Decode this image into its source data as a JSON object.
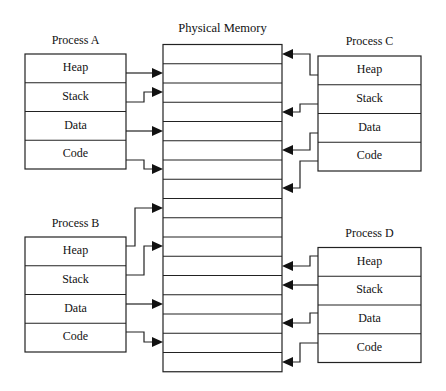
{
  "diagram": {
    "title": "Physical Memory",
    "colors": {
      "stroke": "#222222",
      "background": "#ffffff",
      "text": "#111111"
    },
    "memory": {
      "x": 163,
      "y": 44.5,
      "width": 119,
      "rows": 17,
      "row_height": 19.25
    },
    "processes": [
      {
        "name": "Process A",
        "side": "left",
        "box": {
          "x": 25,
          "y": 54,
          "width": 101,
          "row_height": 28.75
        },
        "label_y": 33,
        "segments": [
          "Heap",
          "Stack",
          "Data",
          "Code"
        ],
        "arrows": [
          {
            "segment": "Heap",
            "from_y": 73,
            "bend_x": 144,
            "to_y": 73
          },
          {
            "segment": "Stack",
            "from_y": 102,
            "bend_x": 144,
            "to_y": 92
          },
          {
            "segment": "Data",
            "from_y": 131,
            "bend_x": 144,
            "to_y": 131
          },
          {
            "segment": "Code",
            "from_y": 160,
            "bend_x": 144,
            "to_y": 169
          }
        ]
      },
      {
        "name": "Process B",
        "side": "left",
        "box": {
          "x": 25,
          "y": 237,
          "width": 101,
          "row_height": 28.75
        },
        "label_y": 216,
        "segments": [
          "Heap",
          "Stack",
          "Data",
          "Code"
        ],
        "arrows": [
          {
            "segment": "Heap",
            "from_y": 246,
            "bend_x": 135,
            "to_y": 208
          },
          {
            "segment": "Stack",
            "from_y": 275,
            "bend_x": 144,
            "to_y": 246
          },
          {
            "segment": "Data",
            "from_y": 304,
            "bend_x": 144,
            "to_y": 304
          },
          {
            "segment": "Code",
            "from_y": 332,
            "bend_x": 144,
            "to_y": 342
          }
        ]
      },
      {
        "name": "Process C",
        "side": "right",
        "box": {
          "x": 318,
          "y": 56,
          "width": 103,
          "row_height": 28.75
        },
        "label_y": 34,
        "segments": [
          "Heap",
          "Stack",
          "Data",
          "Code"
        ],
        "arrows": [
          {
            "segment": "Heap",
            "from_y": 75,
            "bend_x": 310,
            "to_y": 54
          },
          {
            "segment": "Stack",
            "from_y": 104,
            "bend_x": 300,
            "to_y": 112
          },
          {
            "segment": "Data",
            "from_y": 133,
            "bend_x": 310,
            "to_y": 150
          },
          {
            "segment": "Code",
            "from_y": 161,
            "bend_x": 300,
            "to_y": 188
          }
        ]
      },
      {
        "name": "Process D",
        "side": "right",
        "box": {
          "x": 318,
          "y": 247.5,
          "width": 103,
          "row_height": 28.75
        },
        "label_y": 226,
        "segments": [
          "Heap",
          "Stack",
          "Data",
          "Code"
        ],
        "arrows": [
          {
            "segment": "Heap",
            "from_y": 256,
            "bend_x": 310,
            "to_y": 266
          },
          {
            "segment": "Stack",
            "from_y": 285,
            "bend_x": 310,
            "to_y": 285
          },
          {
            "segment": "Data",
            "from_y": 313,
            "bend_x": 310,
            "to_y": 323
          },
          {
            "segment": "Code",
            "from_y": 343,
            "bend_x": 300,
            "to_y": 362
          }
        ]
      }
    ]
  }
}
